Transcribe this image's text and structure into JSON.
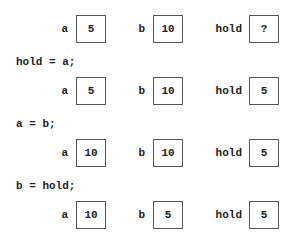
{
  "labels": {
    "a": "a",
    "b": "b",
    "hold": "hold"
  },
  "states": [
    {
      "a": "5",
      "b": "10",
      "hold": "?"
    },
    {
      "a": "5",
      "b": "10",
      "hold": "5"
    },
    {
      "a": "10",
      "b": "10",
      "hold": "5"
    },
    {
      "a": "10",
      "b": "5",
      "hold": "5"
    }
  ],
  "statements": [
    "hold = a;",
    "a = b;",
    "b = hold;"
  ]
}
